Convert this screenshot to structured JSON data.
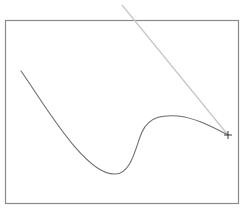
{
  "canvas": {
    "width": 247,
    "height": 215,
    "background": "#ffffff",
    "frame": {
      "x": 5.5,
      "y": 20.5,
      "width": 233,
      "height": 183,
      "stroke": "#8a8a8a",
      "stroke_width": 1.2
    },
    "path": {
      "d": "M 21 71 C 45 105, 85 175, 115 174 C 132 174, 136 145, 142 132 C 150 115, 165 115, 178 116 C 196 118, 212 127, 228 135",
      "stroke": "#6e6e6e",
      "stroke_width": 1.1
    },
    "control_handle": {
      "x1": 228,
      "y1": 135,
      "x2": 122,
      "y2": 5,
      "stroke": "#c8c8c8",
      "stroke_width": 1.3
    },
    "anchor_point": {
      "x": 228,
      "y": 135,
      "size": 4,
      "stroke": "#3a3a3a",
      "icon": "crosshair-icon"
    }
  }
}
